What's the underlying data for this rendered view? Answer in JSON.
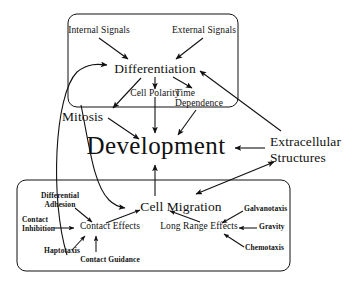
{
  "diagram": {
    "line_color": "#111111",
    "background": "#ffffff",
    "boxes": [
      {
        "id": "differentiation-box",
        "label": ""
      },
      {
        "id": "cell-migration-box",
        "label": ""
      }
    ],
    "nodes": {
      "internal_signals": "Internal Signals",
      "external_signals": "External Signals",
      "differentiation": "Differentiation",
      "cell_polarity": "Cell Polarity",
      "time_dependence_line1": "Time",
      "time_dependence_line2": "Dependence",
      "mitosis": "Mitosis",
      "development": "Development",
      "extracellular_line1": "Extracellular",
      "extracellular_line2": "Structures",
      "cell_migration": "Cell Migration",
      "differential_line1": "Differential",
      "differential_line2": "Adhesion",
      "contact_inhibition_line1": "Contact",
      "contact_inhibition_line2": "Inhibition",
      "contact_effects": "Contact Effects",
      "haptotaxis": "Haptotaxis",
      "contact_guidance": "Contact Guidance",
      "long_range_effects": "Long Range Effects",
      "galvanotaxis": "Galvanotaxis",
      "gravity": "Gravity",
      "chemotaxis": "Chemotaxis"
    },
    "edges": [
      {
        "from": "internal_signals",
        "to": "differentiation",
        "type": "arrow"
      },
      {
        "from": "external_signals",
        "to": "differentiation",
        "type": "arrow"
      },
      {
        "from": "differentiation",
        "to": "cell_polarity",
        "type": "arrow"
      },
      {
        "from": "differentiation",
        "to": "time_dependence",
        "type": "arrow"
      },
      {
        "from": "differentiation",
        "to": "mitosis",
        "type": "arrow"
      },
      {
        "from": "mitosis",
        "to": "development",
        "type": "arrow"
      },
      {
        "from": "cell_polarity",
        "to": "development",
        "type": "arrow"
      },
      {
        "from": "time_dependence",
        "to": "development",
        "type": "arrow"
      },
      {
        "from": "extracellular_structures",
        "to": "development",
        "type": "arrow"
      },
      {
        "from": "extracellular_structures",
        "to": "differentiation",
        "type": "arrow"
      },
      {
        "from": "extracellular_structures",
        "to": "cell_migration_box",
        "type": "double-arrow"
      },
      {
        "from": "cell_migration",
        "to": "development",
        "type": "arrow"
      },
      {
        "from": "contact_effects_region",
        "to": "differentiation",
        "type": "curved-arrow"
      },
      {
        "from": "differentiation_region",
        "to": "cell_migration",
        "type": "curved-arrow"
      },
      {
        "from": "differential_adhesion",
        "to": "contact_effects",
        "type": "arrow"
      },
      {
        "from": "contact_inhibition",
        "to": "contact_effects",
        "type": "arrow"
      },
      {
        "from": "haptotaxis",
        "to": "contact_effects",
        "type": "arrow"
      },
      {
        "from": "contact_guidance",
        "to": "contact_effects",
        "type": "arrow"
      },
      {
        "from": "contact_effects",
        "to": "cell_migration",
        "type": "arrow"
      },
      {
        "from": "long_range_effects",
        "to": "cell_migration",
        "type": "arrow"
      },
      {
        "from": "galvanotaxis",
        "to": "long_range_effects",
        "type": "arrow"
      },
      {
        "from": "gravity",
        "to": "long_range_effects",
        "type": "arrow"
      },
      {
        "from": "chemotaxis",
        "to": "long_range_effects",
        "type": "arrow"
      }
    ]
  }
}
